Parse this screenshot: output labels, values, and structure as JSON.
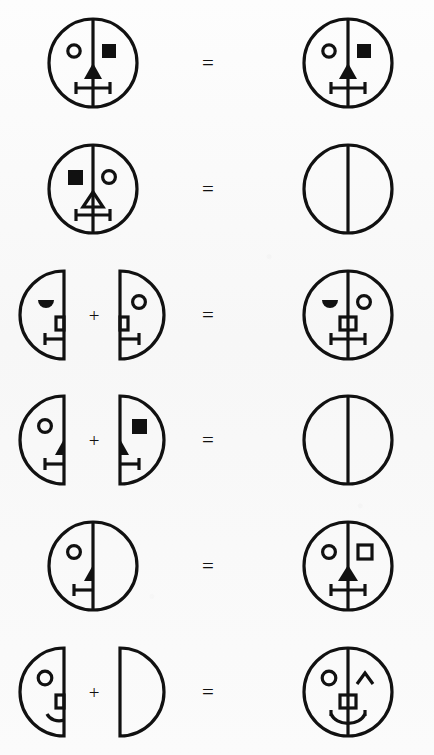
{
  "page": {
    "background_color": "#f8f8f8",
    "ink_color": "#111111",
    "width": 434,
    "height": 755,
    "row_count": 6
  },
  "operators": {
    "plus": "+",
    "equals": "="
  },
  "rows": [
    {
      "id": "row-1",
      "equation": "full-face-filled-square-eye = full-face-filled-square-eye",
      "operator": "=",
      "operator_x": 207,
      "terms": [
        {
          "name": "face-left-operand",
          "shape": "full-circle",
          "cx": 93,
          "r": 46,
          "divider": true,
          "left_eye": "open-circle",
          "right_eye": "filled-square",
          "nose": "filled-triangle",
          "mouth": "bar-with-two-ticks"
        },
        {
          "name": "face-result",
          "shape": "full-circle",
          "cx": 348,
          "r": 46,
          "divider": true,
          "left_eye": "open-circle",
          "right_eye": "filled-square",
          "nose": "filled-triangle",
          "mouth": "bar-with-two-ticks"
        }
      ]
    },
    {
      "id": "row-2",
      "equation": "mirrored-face-hollow-triangle-nose = empty-divided-circle",
      "operator": "=",
      "operator_x": 207,
      "terms": [
        {
          "name": "face-left-operand",
          "shape": "full-circle",
          "cx": 93,
          "r": 46,
          "divider": true,
          "left_eye": "filled-square",
          "right_eye": "open-circle",
          "nose": "hollow-triangle",
          "mouth": "bar-with-two-ticks"
        },
        {
          "name": "empty-face-result",
          "shape": "full-circle",
          "cx": 348,
          "r": 46,
          "divider": true,
          "left_eye": "none",
          "right_eye": "none",
          "nose": "none",
          "mouth": "none"
        }
      ]
    },
    {
      "id": "row-3",
      "equation": "left-half-semicircle-eye + right-half-circle-eye = combined-face-square-nose",
      "operator": "=",
      "operator_x": 207,
      "plus_x": 93,
      "terms": [
        {
          "name": "half-face-left-operand",
          "shape": "left-half",
          "cx": 60,
          "r": 46,
          "left_eye": "filled-semicircle",
          "nose": "half-square",
          "mouth": "half-bar-tick"
        },
        {
          "name": "half-face-right-operand",
          "shape": "right-half",
          "cx": 128,
          "r": 46,
          "right_eye": "open-circle",
          "nose": "half-square",
          "mouth": "half-bar-tick"
        },
        {
          "name": "face-result",
          "shape": "full-circle",
          "cx": 348,
          "r": 46,
          "divider": true,
          "left_eye": "filled-semicircle",
          "right_eye": "open-circle",
          "nose": "square",
          "mouth": "bar-with-two-ticks"
        }
      ]
    },
    {
      "id": "row-4",
      "equation": "left-half-circle-eye + right-half-square-eye = empty-divided-circle",
      "operator": "=",
      "operator_x": 207,
      "plus_x": 93,
      "terms": [
        {
          "name": "half-face-left-operand",
          "shape": "left-half",
          "cx": 60,
          "r": 46,
          "left_eye": "open-circle",
          "nose": "half-triangle",
          "mouth": "half-bar-tick"
        },
        {
          "name": "half-face-right-operand",
          "shape": "right-half",
          "cx": 128,
          "r": 46,
          "right_eye": "filled-square",
          "nose": "half-triangle",
          "mouth": "half-bar-tick"
        },
        {
          "name": "empty-face-result",
          "shape": "full-circle",
          "cx": 348,
          "r": 46,
          "divider": true,
          "left_eye": "none",
          "right_eye": "none",
          "nose": "none",
          "mouth": "none"
        }
      ]
    },
    {
      "id": "row-5",
      "equation": "half-featured-circle = full-face-hollow-square-eye",
      "operator": "=",
      "operator_x": 207,
      "terms": [
        {
          "name": "face-left-operand",
          "shape": "full-circle",
          "cx": 93,
          "r": 46,
          "divider": true,
          "left_eye": "open-circle",
          "right_eye": "none",
          "nose": "half-triangle",
          "mouth": "half-bar-tick"
        },
        {
          "name": "face-result",
          "shape": "full-circle",
          "cx": 348,
          "r": 46,
          "divider": true,
          "left_eye": "open-circle",
          "right_eye": "hollow-square",
          "nose": "filled-triangle",
          "mouth": "bar-with-two-ticks"
        }
      ]
    },
    {
      "id": "row-6",
      "equation": "left-half-smile + empty-right-half = face-with-chevron-and-smile",
      "operator": "=",
      "operator_x": 207,
      "plus_x": 93,
      "terms": [
        {
          "name": "half-face-left-operand",
          "shape": "left-half",
          "cx": 60,
          "r": 46,
          "left_eye": "open-circle",
          "nose": "half-square",
          "mouth": "half-curve"
        },
        {
          "name": "empty-half-right-operand",
          "shape": "right-half",
          "cx": 128,
          "r": 46,
          "right_eye": "none",
          "nose": "none",
          "mouth": "none"
        },
        {
          "name": "face-result",
          "shape": "full-circle",
          "cx": 348,
          "r": 46,
          "divider": true,
          "left_eye": "open-circle",
          "right_eye": "chevron",
          "nose": "square",
          "mouth": "curve-with-ticks"
        }
      ]
    }
  ]
}
